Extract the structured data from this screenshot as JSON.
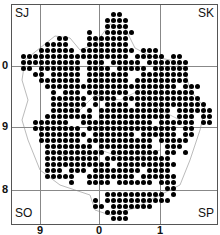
{
  "map": {
    "corner_labels": {
      "top_left": "SJ",
      "top_right": "SK",
      "bottom_left": "SO",
      "bottom_right": "SP"
    },
    "x_ticks": [
      "9",
      "0",
      "1"
    ],
    "y_ticks": [
      "0",
      "9",
      "8"
    ],
    "dot_color": "#000000",
    "grid_color": "#888888",
    "outline_color": "#bbbbbb",
    "dot_grid": {
      "origin_x": 23,
      "origin_y": 14,
      "spacing": 6,
      "rows": [
        "...............##................",
        "..............####...............",
        "..............####...............",
        "...........#..#####..............",
        "......##...#######...............",
        "....####...#######...............",
        "...######.#########.###..........",
        "##################.#####.##.....",
        "##########.###.#####.#######....",
        "##.#######.####.#####.######....",
        "..##.#####.#######..########....",
        "...#######.#######.#########....",
        "....######################.###..",
        ".....#.###.#######.##########...",
        ".....######.####.#############..",
        ".....######.#.####.############.",
        ".....#####.#.############.######",
        "....########.############.###.##",
        "..######..############.######.##",
        "..########.###############.##...",
        "...########.#######.######.##...",
        "...#######.###########.#####....",
        "....########.#########..###.....",
        "....##########.########.##.#....",
        "....#########.###########.......",
        "....###########.##########......",
        "....###.###.########.####.......",
        "....#####..########.######......",
        "........#..####.######.###......",
        "........................##......",
        "..............##########.#......",
        "............#.###########.......",
        "............##.#######..........",
        "..............####..............",
        "...............###.............."
      ]
    }
  }
}
